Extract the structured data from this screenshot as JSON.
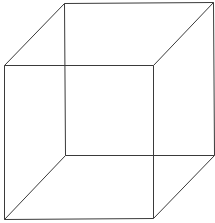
{
  "diagram": {
    "type": "necker-cube-wireframe",
    "stroke_color": "#3a3a3a",
    "background": "#ffffff",
    "vertices": {
      "front_top_left": [
        4,
        65
      ],
      "front_top_right": [
        153,
        65
      ],
      "front_bottom_left": [
        4,
        219
      ],
      "front_bottom_right": [
        153,
        218
      ],
      "back_top_left": [
        64,
        3
      ],
      "back_top_right": [
        213,
        2
      ],
      "back_bottom_left": [
        65,
        155
      ],
      "back_bottom_right": [
        214,
        155
      ]
    },
    "edges": [
      [
        "front_top_left",
        "front_top_right"
      ],
      [
        "front_top_right",
        "front_bottom_right"
      ],
      [
        "front_bottom_right",
        "front_bottom_left"
      ],
      [
        "front_bottom_left",
        "front_top_left"
      ],
      [
        "back_top_left",
        "back_top_right"
      ],
      [
        "back_top_right",
        "back_bottom_right"
      ],
      [
        "back_bottom_right",
        "back_bottom_left"
      ],
      [
        "back_bottom_left",
        "back_top_left"
      ],
      [
        "front_top_left",
        "back_top_left"
      ],
      [
        "front_top_right",
        "back_top_right"
      ],
      [
        "front_bottom_right",
        "back_bottom_right"
      ],
      [
        "front_bottom_left",
        "back_bottom_left"
      ]
    ]
  }
}
